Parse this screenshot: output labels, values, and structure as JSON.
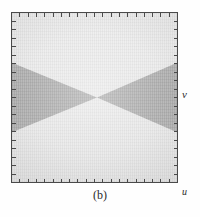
{
  "figure": {
    "caption": "(b)",
    "frame": {
      "border_color": "#4a4a4a",
      "tick_count_horizontal": 20,
      "tick_count_vertical": 20
    },
    "axes": {
      "x_label": "u",
      "y_label": "v"
    },
    "regions": {
      "background_label": "light-gray-field",
      "background_color": "#ececec",
      "shaded_label": "dark-gray-bowtie",
      "shaded_color": "#b9b9b9"
    }
  },
  "chart_data": {
    "type": "area",
    "title": "(b)",
    "xlabel": "u",
    "ylabel": "v",
    "xlim": [
      0,
      1
    ],
    "ylim": [
      0,
      1
    ],
    "grid": false,
    "legend": null,
    "annotations": [],
    "series": [
      {
        "name": "dark-gray-bowtie",
        "color": "#b9b9b9",
        "shape": "two triangles meeting apex-to-apex at the centre",
        "polygons": [
          {
            "name": "left-triangle",
            "vertices": [
              [
                0.0,
                0.705
              ],
              [
                0.0,
                0.295
              ],
              [
                0.515,
                0.5
              ]
            ]
          },
          {
            "name": "right-triangle",
            "vertices": [
              [
                1.0,
                0.705
              ],
              [
                1.0,
                0.295
              ],
              [
                0.515,
                0.5
              ]
            ]
          }
        ]
      },
      {
        "name": "light-gray-field",
        "color": "#ececec",
        "shape": "remaining square region (top and bottom wedges)",
        "polygons": [
          {
            "name": "top-wedge",
            "vertices": [
              [
                0.0,
                0.0
              ],
              [
                1.0,
                0.0
              ],
              [
                1.0,
                0.295
              ],
              [
                0.515,
                0.5
              ],
              [
                0.0,
                0.295
              ]
            ]
          },
          {
            "name": "bottom-wedge",
            "vertices": [
              [
                0.0,
                1.0
              ],
              [
                1.0,
                1.0
              ],
              [
                1.0,
                0.705
              ],
              [
                0.515,
                0.5
              ],
              [
                0.0,
                0.705
              ]
            ]
          }
        ]
      }
    ]
  }
}
